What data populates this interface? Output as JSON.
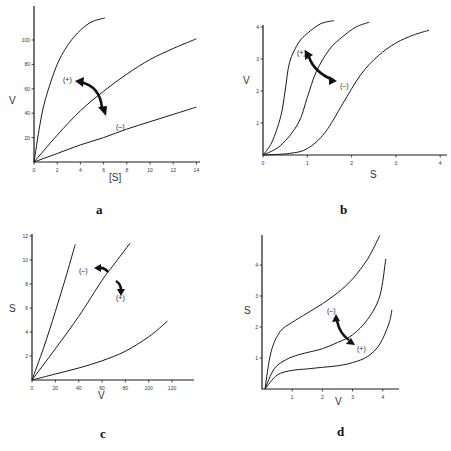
{
  "chart_data": [
    {
      "panel": "a",
      "type": "line",
      "xlabel": "[S]",
      "ylabel": "V",
      "xlim": [
        0,
        14
      ],
      "ylim": [
        0,
        120
      ],
      "xticks": [
        0,
        2,
        4,
        6,
        8,
        10,
        12,
        14
      ],
      "yticks": [
        20,
        40,
        60,
        80,
        100
      ],
      "series": [
        {
          "name": "upper",
          "x": [
            0,
            0.5,
            1,
            2,
            3,
            4,
            5,
            6.1
          ],
          "y": [
            0,
            30,
            52,
            80,
            97,
            108,
            115,
            118
          ]
        },
        {
          "name": "middle",
          "x": [
            0,
            2,
            4,
            6,
            8,
            10,
            12,
            14
          ],
          "y": [
            0,
            22,
            42,
            58,
            72,
            84,
            93,
            101
          ]
        },
        {
          "name": "lower",
          "x": [
            0,
            2,
            4,
            6,
            8,
            10,
            12,
            14
          ],
          "y": [
            0,
            7,
            14,
            20,
            27,
            33,
            39,
            45
          ]
        }
      ],
      "annotations": [
        {
          "text": "(+)",
          "x": 2.5,
          "y": 65
        },
        {
          "text": "(–)",
          "x": 7.4,
          "y": 28
        }
      ],
      "grid": false
    },
    {
      "panel": "b",
      "type": "line",
      "xlabel": "S",
      "ylabel": "V",
      "xlim": [
        0,
        4.2
      ],
      "ylim": [
        0,
        4
      ],
      "xticks": [
        0,
        1,
        2,
        3,
        4
      ],
      "yticks": [
        1,
        2,
        3,
        4
      ],
      "series": [
        {
          "name": "left",
          "x": [
            0,
            0.2,
            0.4,
            0.5,
            0.6,
            0.8,
            1.0,
            1.3,
            1.6
          ],
          "y": [
            0,
            0.4,
            1.2,
            2.0,
            2.9,
            3.5,
            3.8,
            4.1,
            4.2
          ]
        },
        {
          "name": "middle",
          "x": [
            0,
            0.4,
            0.8,
            1.0,
            1.2,
            1.5,
            1.8,
            2.1,
            2.4
          ],
          "y": [
            0,
            0.3,
            1.0,
            1.8,
            2.6,
            3.3,
            3.7,
            4.0,
            4.15
          ]
        },
        {
          "name": "right",
          "x": [
            0,
            0.6,
            1.0,
            1.4,
            1.8,
            2.2,
            2.6,
            3.0,
            3.4,
            3.75
          ],
          "y": [
            0,
            0.05,
            0.2,
            0.7,
            1.6,
            2.5,
            3.1,
            3.5,
            3.75,
            3.9
          ]
        }
      ],
      "annotations": [
        {
          "text": "(+)",
          "x": 0.75,
          "y": 3.25
        },
        {
          "text": "(–)",
          "x": 1.85,
          "y": 2.1
        }
      ],
      "grid": false
    },
    {
      "panel": "c",
      "type": "line",
      "xlabel": "V",
      "ylabel": "S",
      "xlim": [
        0,
        140
      ],
      "ylim": [
        0,
        12
      ],
      "xticks": [
        0,
        20,
        40,
        60,
        80,
        100,
        120
      ],
      "yticks": [
        2,
        4,
        6,
        8,
        10,
        12
      ],
      "series": [
        {
          "name": "steep",
          "x": [
            0,
            10,
            20,
            30,
            37
          ],
          "y": [
            0,
            2.7,
            5.7,
            8.9,
            11.3
          ]
        },
        {
          "name": "middle",
          "x": [
            0,
            20,
            40,
            60,
            70,
            84
          ],
          "y": [
            0,
            2.6,
            5.3,
            8.3,
            9.6,
            11.4
          ]
        },
        {
          "name": "shallow",
          "x": [
            0,
            20,
            40,
            60,
            80,
            100,
            116
          ],
          "y": [
            0,
            0.5,
            1.0,
            1.6,
            2.4,
            3.6,
            4.9
          ]
        }
      ],
      "annotations": [
        {
          "text": "(–)",
          "x": 48,
          "y": 9.2
        },
        {
          "text": "(+)",
          "x": 79,
          "y": 7.2
        }
      ],
      "grid": false
    },
    {
      "panel": "d",
      "type": "line",
      "xlabel": "V",
      "ylabel": "S",
      "xlim": [
        0,
        4.4
      ],
      "ylim": [
        0,
        5
      ],
      "xticks": [
        1,
        2,
        3,
        4
      ],
      "yticks": [
        1,
        2,
        3,
        4
      ],
      "series": [
        {
          "name": "upper",
          "x": [
            0.1,
            0.3,
            0.6,
            1.0,
            1.5,
            2.0,
            2.5,
            3.0,
            3.5,
            3.9
          ],
          "y": [
            0,
            1.2,
            1.85,
            2.15,
            2.45,
            2.75,
            3.1,
            3.55,
            4.2,
            4.95
          ]
        },
        {
          "name": "middle",
          "x": [
            0.1,
            0.4,
            0.8,
            1.2,
            1.6,
            2.0,
            2.5,
            3.0,
            3.5,
            3.9,
            4.1
          ],
          "y": [
            0,
            0.65,
            0.95,
            1.1,
            1.2,
            1.3,
            1.5,
            1.75,
            2.25,
            3.0,
            4.2
          ]
        },
        {
          "name": "lower",
          "x": [
            0.1,
            0.5,
            1.0,
            1.5,
            2.0,
            2.5,
            3.0,
            3.5,
            3.9,
            4.2,
            4.3
          ],
          "y": [
            0,
            0.45,
            0.6,
            0.65,
            0.7,
            0.75,
            0.85,
            1.05,
            1.45,
            2.1,
            2.55
          ]
        }
      ],
      "annotations": [
        {
          "text": "(–)",
          "x": 2.0,
          "y": 2.5
        },
        {
          "text": "(+)",
          "x": 3.2,
          "y": 1.3
        }
      ],
      "grid": false
    }
  ],
  "panels": [
    {
      "label": "a",
      "xlabel": "[S]",
      "ylabel": "V",
      "ann1": "(+)",
      "ann2": "(–)"
    },
    {
      "label": "b",
      "xlabel": "S",
      "ylabel": "V",
      "ann1": "(+)",
      "ann2": "(–)"
    },
    {
      "label": "c",
      "xlabel": "V",
      "ylabel": "S",
      "ann1": "(–)",
      "ann2": "(+)"
    },
    {
      "label": "d",
      "xlabel": "V",
      "ylabel": "S",
      "ann1": "(–)",
      "ann2": "(+)"
    }
  ]
}
